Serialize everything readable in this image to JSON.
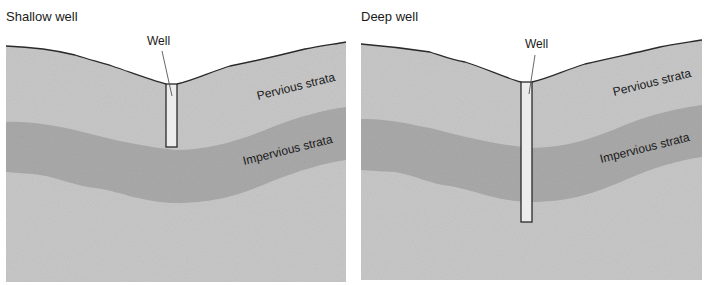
{
  "panels": [
    {
      "title": "Shallow well",
      "well_label": "Well",
      "pervious_label": "Pervious strata",
      "impervious_label": "Impervious strata"
    },
    {
      "title": "Deep well",
      "well_label": "Well",
      "pervious_label": "Pervious strata",
      "impervious_label": "Impervious strata"
    }
  ],
  "colors": {
    "pervious": "#c8c8c8",
    "impervious": "#a9a9a9",
    "well": "#ececec",
    "outline": "#2a2a2a"
  }
}
